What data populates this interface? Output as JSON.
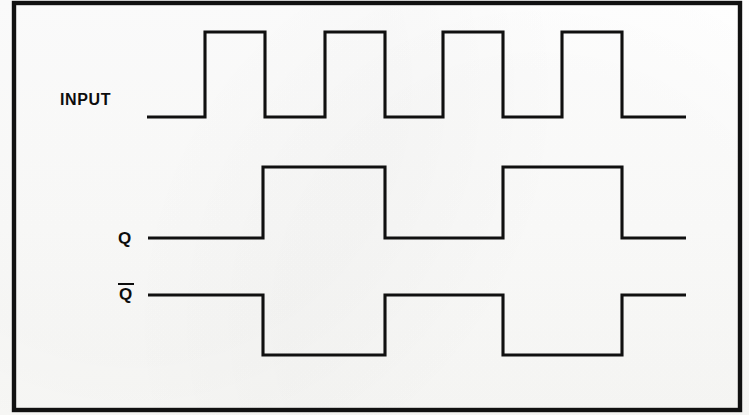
{
  "figure": {
    "kind": "digital-timing-diagram",
    "background_color": "#ffffff",
    "ink_color": "#101010",
    "border": {
      "present": true,
      "color": "#111111",
      "x": 14,
      "y": 3,
      "width": 726,
      "height": 407,
      "stroke_width": 4.4
    }
  },
  "labels": {
    "input": "INPUT",
    "q": "Q",
    "qbar_base": "Q",
    "qbar_has_overbar": true
  },
  "chart_data": {
    "type": "line",
    "title": "",
    "xlabel": "",
    "ylabel": "",
    "grid": false,
    "legend_position": "left",
    "x_axis": {
      "unit": "pixels",
      "min": 147,
      "max": 686
    },
    "signals": [
      {
        "name": "INPUT",
        "label": "INPUT",
        "low_y": 117,
        "high_y": 32,
        "lead_in_start_x": 147,
        "end_x": 686,
        "period_px": 118,
        "high_width_px": 60,
        "pulse_count": 4,
        "rising_edges": [
          205,
          325,
          443,
          562
        ],
        "falling_edges": [
          265,
          385,
          503,
          622
        ],
        "levels": [
          {
            "x_start": 147,
            "x_end": 205,
            "state": 0
          },
          {
            "x_start": 205,
            "x_end": 265,
            "state": 1
          },
          {
            "x_start": 265,
            "x_end": 325,
            "state": 0
          },
          {
            "x_start": 325,
            "x_end": 385,
            "state": 1
          },
          {
            "x_start": 385,
            "x_end": 443,
            "state": 0
          },
          {
            "x_start": 443,
            "x_end": 503,
            "state": 1
          },
          {
            "x_start": 503,
            "x_end": 562,
            "state": 0
          },
          {
            "x_start": 562,
            "x_end": 622,
            "state": 1
          },
          {
            "x_start": 622,
            "x_end": 686,
            "state": 0
          }
        ]
      },
      {
        "name": "Q",
        "label": "Q",
        "low_y": 238,
        "high_y": 167,
        "lead_in_start_x": 148,
        "end_x": 686,
        "period_px": 240,
        "pulse_count": 2,
        "rising_edges": [
          263,
          503
        ],
        "falling_edges": [
          385,
          622
        ],
        "levels": [
          {
            "x_start": 148,
            "x_end": 263,
            "state": 0
          },
          {
            "x_start": 263,
            "x_end": 385,
            "state": 1
          },
          {
            "x_start": 385,
            "x_end": 503,
            "state": 0
          },
          {
            "x_start": 503,
            "x_end": 622,
            "state": 1
          },
          {
            "x_start": 622,
            "x_end": 686,
            "state": 0
          }
        ]
      },
      {
        "name": "QBAR",
        "label": "Q",
        "low_y": 355,
        "high_y": 295,
        "lead_in_start_x": 148,
        "end_x": 686,
        "period_px": 240,
        "pulse_count": 2,
        "rising_edges": [
          385,
          622
        ],
        "falling_edges": [
          263,
          503
        ],
        "levels": [
          {
            "x_start": 148,
            "x_end": 263,
            "state": 1
          },
          {
            "x_start": 263,
            "x_end": 385,
            "state": 0
          },
          {
            "x_start": 385,
            "x_end": 503,
            "state": 1
          },
          {
            "x_start": 503,
            "x_end": 622,
            "state": 0
          },
          {
            "x_start": 622,
            "x_end": 686,
            "state": 1
          }
        ]
      }
    ]
  }
}
